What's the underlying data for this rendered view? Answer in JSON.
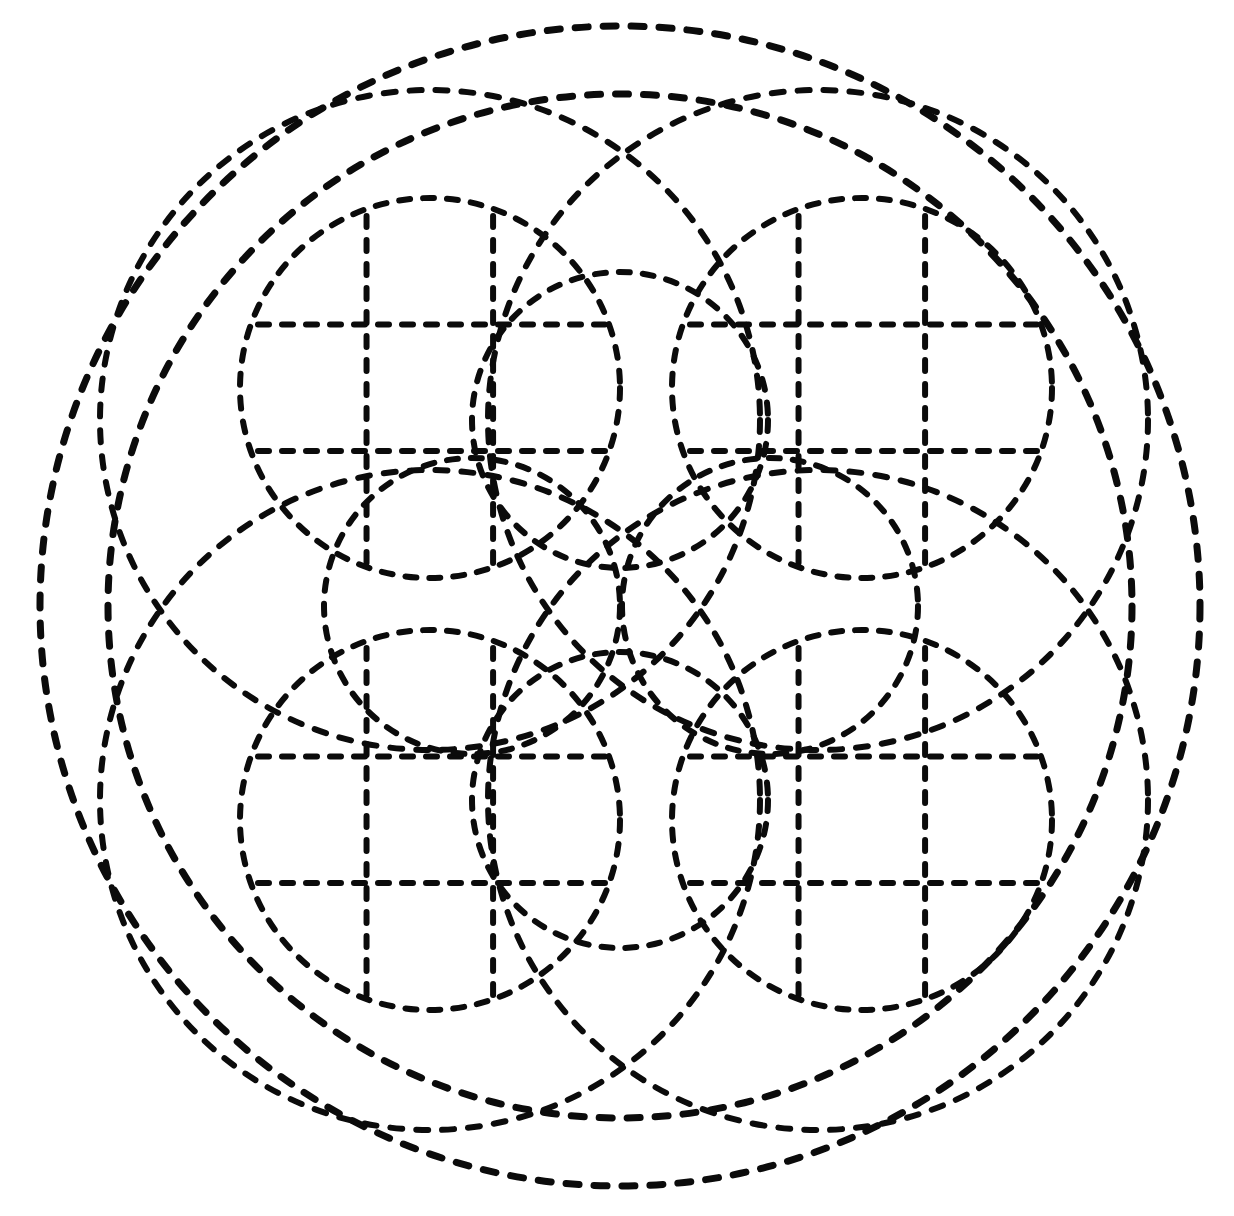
{
  "figure": {
    "title": "Dashed-line geometric rosette",
    "background_color": "#ffffff",
    "stroke_color": "#000000",
    "canvas": {
      "width": 1234,
      "height": 1216
    }
  },
  "style": {
    "stroke_color": "#0b0b0b",
    "stroke_width_outer": 7,
    "stroke_width_medium": 6,
    "stroke_width_small": 6,
    "stroke_width_grid": 6,
    "dash_outer": "13 15",
    "dash_medium": "12 14",
    "dash_small": "11 13",
    "dash_grid": "11 13",
    "linecap": "round"
  },
  "geometry": {
    "center": {
      "x": 620,
      "y": 606
    },
    "outer_circles": [
      {
        "name": "outer-ring-1",
        "cx": 620,
        "cy": 606,
        "r": 580
      },
      {
        "name": "outer-ring-2",
        "cx": 620,
        "cy": 606,
        "r": 512
      }
    ],
    "medium_circles": [
      {
        "name": "medium-circle-top-left",
        "cx": 430,
        "cy": 420,
        "r": 330
      },
      {
        "name": "medium-circle-top-right",
        "cx": 818,
        "cy": 420,
        "r": 330
      },
      {
        "name": "medium-circle-bottom-left",
        "cx": 430,
        "cy": 800,
        "r": 330
      },
      {
        "name": "medium-circle-bottom-right",
        "cx": 818,
        "cy": 800,
        "r": 330
      }
    ],
    "gridded_circles": [
      {
        "name": "gridded-circle-top-left",
        "cx": 430,
        "cy": 388,
        "r": 190
      },
      {
        "name": "gridded-circle-top-right",
        "cx": 862,
        "cy": 388,
        "r": 190
      },
      {
        "name": "gridded-circle-bottom-left",
        "cx": 430,
        "cy": 820,
        "r": 190
      },
      {
        "name": "gridded-circle-bottom-right",
        "cx": 862,
        "cy": 820,
        "r": 190
      }
    ],
    "rosette_circles": [
      {
        "name": "rosette-circle-top",
        "cx": 620,
        "cy": 420,
        "r": 148
      },
      {
        "name": "rosette-circle-bottom",
        "cx": 620,
        "cy": 800,
        "r": 148
      },
      {
        "name": "rosette-circle-left",
        "cx": 472,
        "cy": 606,
        "r": 148
      },
      {
        "name": "rosette-circle-right",
        "cx": 770,
        "cy": 606,
        "r": 148
      }
    ],
    "grid": {
      "divisions": 3,
      "line_fractions": [
        0.333,
        0.666
      ],
      "note": "Each gridded circle carries a 3x3 lattice of dashed straight lines clipped to the circle."
    }
  },
  "chart_data": {
    "type": "scatter",
    "title": "Dashed-line geometric rosette",
    "xlabel": "",
    "ylabel": "",
    "xlim": [
      0,
      1234
    ],
    "ylim": [
      0,
      1216
    ],
    "grid": false,
    "legend": "none",
    "series": [
      {
        "name": "Outer concentric rings",
        "shape": "circle",
        "count": 2,
        "radii": [
          580,
          512
        ],
        "centers": [
          [
            620,
            606
          ],
          [
            620,
            606
          ]
        ]
      },
      {
        "name": "Medium quadrant circles",
        "shape": "circle",
        "count": 4,
        "radii": [
          330,
          330,
          330,
          330
        ],
        "centers": [
          [
            430,
            420
          ],
          [
            818,
            420
          ],
          [
            430,
            800
          ],
          [
            818,
            800
          ]
        ]
      },
      {
        "name": "Gridded inner circles",
        "shape": "circle",
        "count": 4,
        "radii": [
          190,
          190,
          190,
          190
        ],
        "centers": [
          [
            430,
            388
          ],
          [
            862,
            388
          ],
          [
            430,
            820
          ],
          [
            862,
            820
          ]
        ]
      },
      {
        "name": "Central rosette circles",
        "shape": "circle",
        "count": 4,
        "radii": [
          148,
          148,
          148,
          148
        ],
        "centers": [
          [
            620,
            420
          ],
          [
            620,
            800
          ],
          [
            472,
            606
          ],
          [
            770,
            606
          ]
        ]
      }
    ]
  }
}
